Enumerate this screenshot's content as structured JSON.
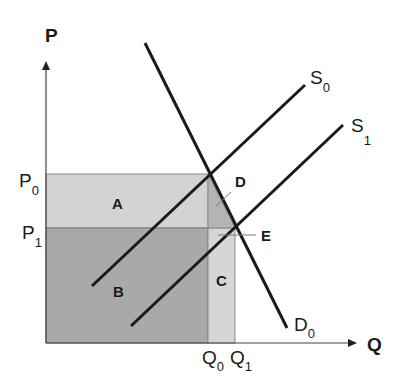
{
  "diagram": {
    "axes": {
      "y_label": "P",
      "x_label": "Q"
    },
    "price_ticks": [
      {
        "base": "P",
        "sub": "0"
      },
      {
        "base": "P",
        "sub": "1"
      }
    ],
    "quantity_ticks": [
      {
        "base": "Q",
        "sub": "0"
      },
      {
        "base": "Q",
        "sub": "1"
      }
    ],
    "curves": {
      "supply_0": {
        "base": "S",
        "sub": "0"
      },
      "supply_1": {
        "base": "S",
        "sub": "1"
      },
      "demand_0": {
        "base": "D",
        "sub": "0"
      }
    },
    "regions": {
      "A": "A",
      "B": "B",
      "C": "C",
      "D": "D"
    },
    "points": {
      "E": "E"
    },
    "colors": {
      "region_A": "#d3d3d3",
      "region_B": "#a9a9a9",
      "region_C": "#d6d6d6",
      "region_D": "#b4b4b4",
      "lines": "#1a1a1a"
    }
  }
}
